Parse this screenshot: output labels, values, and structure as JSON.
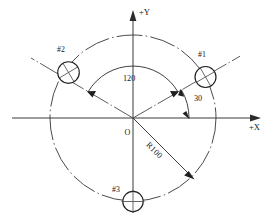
{
  "drawing": {
    "title": "Bolt circle hole pattern",
    "axes": {
      "x_label": "+X",
      "y_label": "+Y",
      "origin_label": "O"
    },
    "dimensions": {
      "radius_label": "R100",
      "radius_value": 100,
      "angle_between_holes_label": "120",
      "angle_between_holes_value": 120,
      "start_angle_label": "30",
      "start_angle_value": 30,
      "angle_unit": "degrees"
    },
    "holes": [
      {
        "label": "#1",
        "angle_deg": 30,
        "cx": 205.5,
        "cy": 77.0,
        "r": 10.5,
        "cross": "diagonal"
      },
      {
        "label": "#2",
        "angle_deg": 150,
        "cx": 68.5,
        "cy": 72.5,
        "r": 10.8,
        "cross": "diagonal"
      },
      {
        "label": "#3",
        "angle_deg": 270,
        "cx": 133.0,
        "cy": 201.5,
        "r": 10.2,
        "cross": "orthogonal"
      }
    ],
    "geometry": {
      "center_x": 133,
      "center_y": 118,
      "bolt_circle_radius_px": 83
    },
    "colors": {
      "line": "#3a3a3a",
      "centerline": "#4a4a4a",
      "hole_stroke": "#1f1f1f",
      "text": "#171717",
      "background": "#ffffff"
    }
  }
}
